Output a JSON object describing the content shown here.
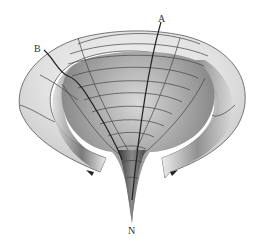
{
  "figure": {
    "type": "3D surface diagram (funnel / cut-away torus-like surface with coordinate grid)",
    "labels": {
      "a": "A",
      "b": "B",
      "n": "N"
    },
    "colors": {
      "background": "#ffffff",
      "surface_light": "#ececec",
      "surface_mid": "#b8b8b8",
      "surface_dark": "#555555",
      "grid_lines": "#444444",
      "geodesic_lines": "#222222"
    }
  }
}
